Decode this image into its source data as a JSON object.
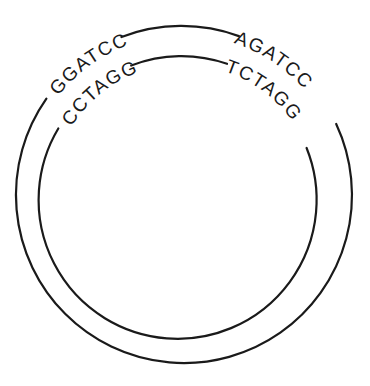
{
  "diagram": {
    "type": "circular plasmid / double-stranded DNA",
    "outer_strand": {
      "left_site": "GGATCC",
      "right_site": "AGATCC"
    },
    "inner_strand": {
      "left_site": "CCTAGG",
      "right_site": "TCTAGG"
    },
    "colors": {
      "stroke": "#1a1a1a",
      "background": "#ffffff"
    }
  }
}
